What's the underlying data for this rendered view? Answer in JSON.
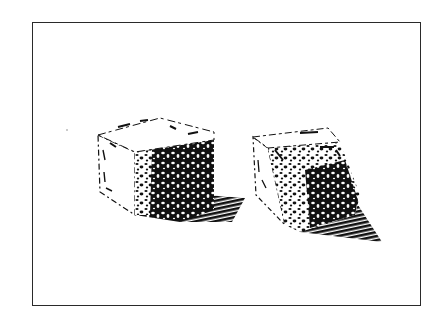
{
  "illustration": {
    "subject": "Two textured cubes casting shadows",
    "style": "black ink pen-and-stipple drawing",
    "colors": {
      "ink": "#111111",
      "paper": "#ffffff",
      "frame": "#2a2a2a"
    },
    "objects": [
      {
        "name": "left-cube",
        "description": "Cube with pale top and left faces, heavily stippled dark right face, shadow cast to the right"
      },
      {
        "name": "right-cube",
        "description": "Cube rotated diagonally, pale top face, stippled front face, long dark wedge-shaped shadow to the lower right"
      }
    ]
  }
}
